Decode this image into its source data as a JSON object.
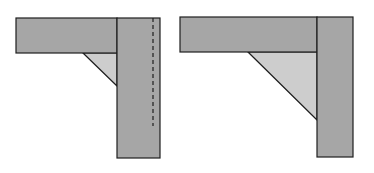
{
  "diagram": {
    "colors": {
      "member_fill": "#a6a6a6",
      "gusset_fill": "#cdcdcd",
      "stroke": "#1e1e1e",
      "background": "#ffffff"
    },
    "left_joint": {
      "beam": {
        "x": 16,
        "y": 18,
        "w": 101,
        "h": 35
      },
      "post": {
        "x": 117,
        "y": 18,
        "w": 43,
        "h": 140
      },
      "gusset": [
        [
          83,
          53
        ],
        [
          117,
          53
        ],
        [
          117,
          86
        ]
      ],
      "dashed_line": {
        "x": 153,
        "y1": 18,
        "y2": 126
      }
    },
    "right_joint": {
      "beam": {
        "x": 180,
        "y": 17,
        "w": 137,
        "h": 35
      },
      "post": {
        "x": 317,
        "y": 17,
        "w": 36,
        "h": 140
      },
      "gusset": [
        [
          248,
          52
        ],
        [
          317,
          52
        ],
        [
          317,
          120
        ]
      ]
    }
  }
}
